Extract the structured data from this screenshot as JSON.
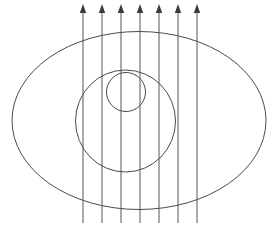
{
  "canvas": {
    "width": 275,
    "height": 229,
    "background_color": "#ffffff",
    "title": "Uniform vertical field lines crossing three nested closed surfaces"
  },
  "style": {
    "curve_stroke_color": "#4a4a4a",
    "curve_stroke_width": 1,
    "fieldline_stroke_color": "#555555",
    "fieldline_stroke_width": 1,
    "arrowhead_fill_color": "#3a3a3a"
  },
  "shapes": {
    "outer_ellipse": {
      "label": "outer-ellipse",
      "cx": 139,
      "cy": 120.5,
      "rx": 127,
      "ry": 89
    },
    "middle_ellipse": {
      "label": "middle-ellipse",
      "cx": 125.5,
      "cy": 121,
      "rx": 50,
      "ry": 51
    },
    "inner_circle": {
      "label": "inner-circle",
      "cx": 126,
      "cy": 92,
      "r": 19.5
    }
  },
  "field_lines": {
    "count": 7,
    "direction": "upward",
    "top_y": 12,
    "bottom_y": 223,
    "arrow_tip_y": 4,
    "arrow_half_width": 3.2,
    "arrow_length": 9,
    "x_positions": [
      83,
      102,
      121,
      140,
      159,
      178,
      197
    ]
  },
  "chart_data": {
    "type": "scatter",
    "xlabel": "",
    "ylabel": "",
    "series": [
      {
        "name": "field-lines",
        "x": [
          83,
          102,
          121,
          140,
          159,
          178,
          197
        ],
        "values": [
          211,
          211,
          211,
          211,
          211,
          211,
          211
        ]
      }
    ],
    "annotations": [
      "outer ellipse rx=127 ry=89",
      "middle ellipse rx=50 ry=51",
      "inner circle r=19.5"
    ]
  }
}
